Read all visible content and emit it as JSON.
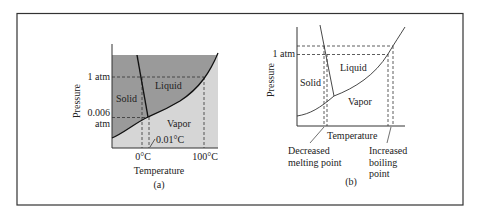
{
  "panel_a": {
    "ylabel": "Pressure",
    "xlabel": "Temperature",
    "caption": "(a)",
    "y_ticks": {
      "one_atm": "1 atm",
      "triple_p_line1": "0.006",
      "triple_p_line2": "atm"
    },
    "x_ticks": {
      "zero": "0°C",
      "hundred": "100°C"
    },
    "triple_point_label": "0.01°C",
    "regions": {
      "solid": "Solid",
      "liquid": "Liquid",
      "vapor": "Vapor"
    },
    "colors": {
      "solid_liquid_fill": "#9a9a9a",
      "vapor_fill": "#d6d6d6",
      "line": "#111111"
    }
  },
  "panel_b": {
    "ylabel": "Pressure",
    "xlabel": "Temperature",
    "caption": "(b)",
    "y_ticks": {
      "one_atm": "1 atm"
    },
    "regions": {
      "solid": "Solid",
      "liquid": "Liquid",
      "vapor": "Vapor"
    },
    "annotations": {
      "melting_line1": "Decreased",
      "melting_line2": "melting point",
      "boiling_line1": "Increased",
      "boiling_line2": "boiling",
      "boiling_line3": "point"
    }
  }
}
